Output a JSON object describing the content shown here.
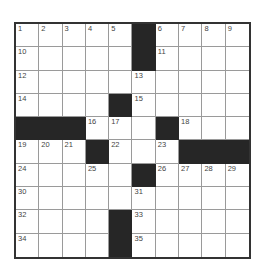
{
  "puzzle": {
    "rows": 10,
    "cols": 10,
    "grid": [
      [
        "1",
        "2",
        "3",
        "4",
        "5",
        "#",
        "6",
        "7",
        "8",
        "9"
      ],
      [
        "10",
        "",
        "",
        "",
        "",
        "#",
        "11",
        "",
        "",
        ""
      ],
      [
        "12",
        "",
        "",
        "",
        "",
        "13",
        "",
        "",
        "",
        ""
      ],
      [
        "14",
        "",
        "",
        "",
        "#",
        "15",
        "",
        "",
        "",
        ""
      ],
      [
        "#",
        "#",
        "#",
        "16",
        "17",
        "",
        "#",
        "18",
        "",
        ""
      ],
      [
        "19",
        "20",
        "21",
        "#",
        "22",
        "",
        "23",
        "#",
        "#",
        "#"
      ],
      [
        "24",
        "",
        "",
        "25",
        "",
        "#",
        "26",
        "27",
        "28",
        "29"
      ],
      [
        "30",
        "",
        "",
        "",
        "",
        "31",
        "",
        "",
        "",
        ""
      ],
      [
        "32",
        "",
        "",
        "",
        "#",
        "33",
        "",
        "",
        "",
        ""
      ],
      [
        "34",
        "",
        "",
        "",
        "#",
        "35",
        "",
        "",
        "",
        ""
      ]
    ],
    "colors": {
      "block": "#262626",
      "border": "#333333",
      "gridline": "#9a9a9a",
      "number": "#444444"
    }
  }
}
